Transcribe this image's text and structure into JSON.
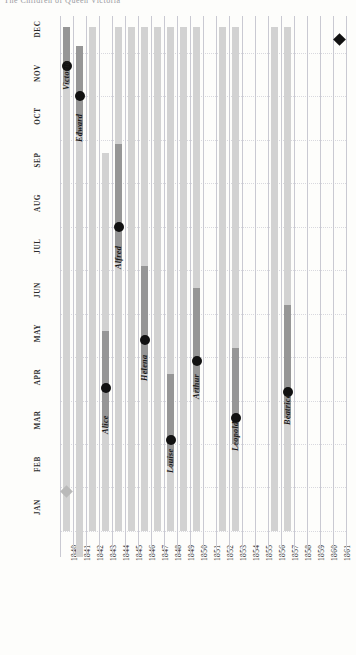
{
  "title_partial": "The Children of Queen Victoria",
  "chart_data": {
    "type": "bar",
    "title": "The Children of Queen Victoria",
    "xlabel": "",
    "ylabel": "",
    "orientation": "vertical-columns-by-year",
    "grid": true,
    "legend": "none",
    "x_tick_labels": [
      "1840",
      "1841",
      "1842",
      "1843",
      "1844",
      "1845",
      "1846",
      "1847",
      "1848",
      "1849",
      "1850",
      "1851",
      "1852",
      "1853",
      "1854",
      "1855",
      "1856",
      "1857",
      "1858",
      "1859",
      "1860",
      "1861"
    ],
    "y_tick_labels": [
      "JAN",
      "FEB",
      "MAR",
      "APR",
      "MAY",
      "JUN",
      "JUL",
      "AUG",
      "SEP",
      "OCT",
      "NOV",
      "DEC"
    ],
    "ylim": [
      "JAN",
      "DEC"
    ],
    "xlim": [
      "1840",
      "1861"
    ],
    "colors": {
      "light_bar": "#d2d2d2",
      "dark_bar": "#969696",
      "marker": "#111111",
      "gridline": "#c9c9d2",
      "monthline": "#d8d8de",
      "background": "#fdfdfb"
    },
    "series": [
      {
        "name": "Victoria",
        "year": "1840",
        "col": 0,
        "light_from_month": 1.0,
        "light_to_month": 12.6,
        "dark_from_month": 11.3,
        "dark_to_month": 12.6,
        "birth_month": 11.7,
        "birth_label": "NOV"
      },
      {
        "name": "Edward",
        "year": "1841",
        "col": 1,
        "light_from_month": 0.4,
        "light_to_month": 1.4,
        "dark_from_month": 10.1,
        "dark_to_month": 12.15,
        "light2_from_month": 1.4,
        "light2_to_month": 10.1,
        "birth_month": 11.0,
        "birth_label": "NOV"
      },
      {
        "name": "Alice",
        "year": "1843",
        "col": 3,
        "light_from_month": 1.0,
        "light_to_month": 9.7,
        "dark_from_month": 3.4,
        "dark_to_month": 5.6,
        "birth_month": 4.3,
        "birth_label": "APR"
      },
      {
        "name": "Alfred",
        "year": "1844",
        "col": 4,
        "light_from_month": 1.0,
        "light_to_month": 12.6,
        "dark_from_month": 7.2,
        "dark_to_month": 9.9,
        "birth_month": 8.0,
        "birth_label": "AUG"
      },
      {
        "name": "Helena",
        "year": "1846",
        "col": 6,
        "light_from_month": 1.0,
        "light_to_month": 12.6,
        "dark_from_month": 4.6,
        "dark_to_month": 7.1,
        "birth_month": 5.4,
        "birth_label": "MAY"
      },
      {
        "name": "Louise",
        "year": "1848",
        "col": 8,
        "light_from_month": 1.0,
        "light_to_month": 12.6,
        "dark_from_month": 2.5,
        "dark_to_month": 4.6,
        "birth_month": 3.1,
        "birth_label": "MAR"
      },
      {
        "name": "Arthur",
        "year": "1850",
        "col": 10,
        "light_from_month": 1.0,
        "light_to_month": 12.6,
        "dark_from_month": 4.2,
        "dark_to_month": 6.6,
        "birth_month": 4.9,
        "birth_label": "MAY"
      },
      {
        "name": "Leopold",
        "year": "1853",
        "col": 13,
        "light_from_month": 1.0,
        "light_to_month": 12.6,
        "dark_from_month": 3.0,
        "dark_to_month": 5.2,
        "birth_month": 3.6,
        "birth_label": "APR"
      },
      {
        "name": "Beatrice",
        "year": "1857",
        "col": 17,
        "light_from_month": 1.0,
        "light_to_month": 12.6,
        "dark_from_month": 3.6,
        "dark_to_month": 6.2,
        "birth_month": 4.2,
        "birth_label": "APR"
      }
    ],
    "plain_columns": [
      {
        "year": "1842",
        "col": 2,
        "light_from_month": 1.0,
        "light_to_month": 12.6
      },
      {
        "year": "1845",
        "col": 5,
        "light_from_month": 1.0,
        "light_to_month": 12.6
      },
      {
        "year": "1847",
        "col": 7,
        "light_from_month": 1.0,
        "light_to_month": 12.6
      },
      {
        "year": "1849",
        "col": 9,
        "light_from_month": 1.0,
        "light_to_month": 12.6
      },
      {
        "year": "1852",
        "col": 12,
        "light_from_month": 1.0,
        "light_to_month": 12.6
      },
      {
        "year": "1856",
        "col": 16,
        "light_from_month": 1.0,
        "light_to_month": 12.6
      }
    ],
    "markers": [
      {
        "kind": "diamond",
        "label": "marriage",
        "col": 0,
        "month": 1.9,
        "faint": true
      },
      {
        "kind": "diamond",
        "label": "death-of-albert",
        "col": 21,
        "month": 12.3,
        "faint": false
      }
    ],
    "annotations": [
      {
        "text": "Victoria",
        "col": 0
      },
      {
        "text": "Edward",
        "col": 1
      },
      {
        "text": "Alice",
        "col": 3
      },
      {
        "text": "Alfred",
        "col": 4
      },
      {
        "text": "Helena",
        "col": 6
      },
      {
        "text": "Louise",
        "col": 8
      },
      {
        "text": "Arthur",
        "col": 10
      },
      {
        "text": "Leopold",
        "col": 13
      },
      {
        "text": "Beatrice",
        "col": 17
      }
    ]
  }
}
